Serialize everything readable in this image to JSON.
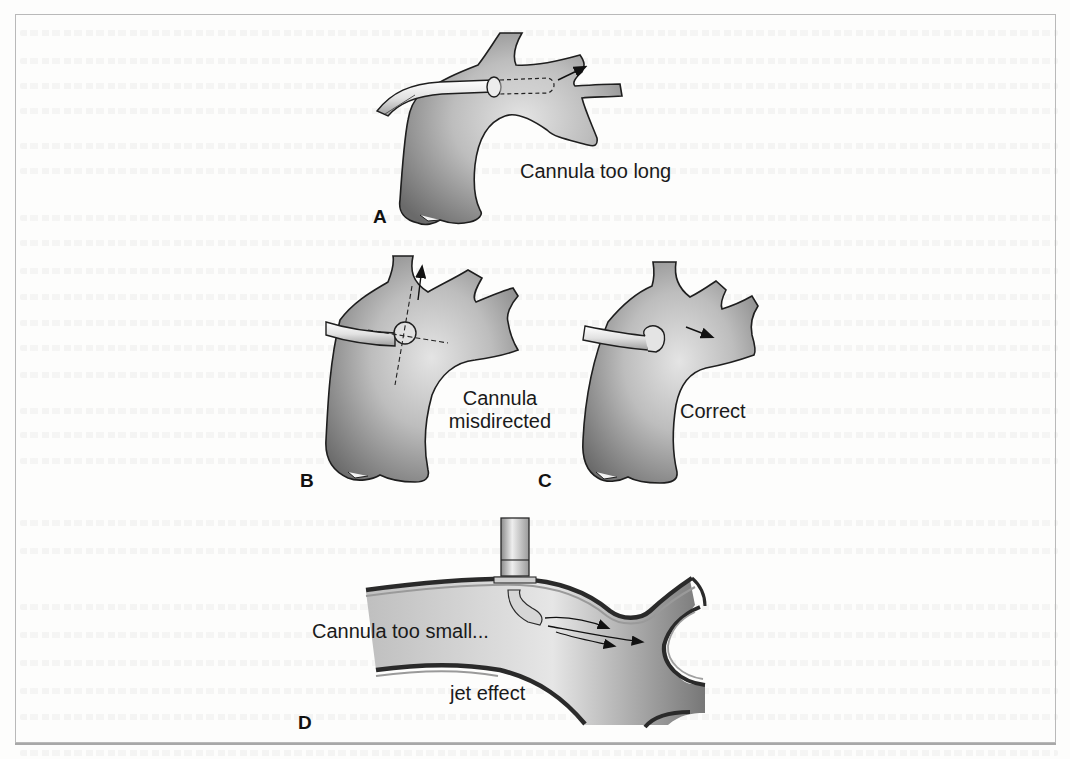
{
  "figure": {
    "type": "medical illustration",
    "colors": {
      "vessel_dark": "#6e6e6e",
      "vessel_light": "#d9d9d9",
      "outline": "#1e1e1e",
      "cannula": "#e6e6e6",
      "frame": "#b9b9b9"
    },
    "panels": [
      {
        "letter": "A",
        "label": "Cannula too long"
      },
      {
        "letter": "B",
        "label_line1": "Cannula",
        "label_line2": "misdirected"
      },
      {
        "letter": "C",
        "label": "Correct"
      },
      {
        "letter": "D",
        "label": "Cannula too small...",
        "sublabel": "jet effect"
      }
    ]
  }
}
